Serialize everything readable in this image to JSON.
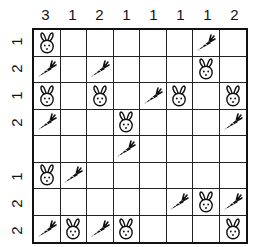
{
  "puzzle": {
    "columns": 8,
    "rows": 8,
    "column_clues": [
      "3",
      "1",
      "2",
      "1",
      "1",
      "1",
      "1",
      "2"
    ],
    "row_clues": [
      "1",
      "2",
      "1",
      "2",
      "",
      "1",
      "2",
      "2"
    ],
    "cells": [
      [
        "bunny",
        "",
        "",
        "",
        "",
        "",
        "carrot",
        ""
      ],
      [
        "carrot",
        "",
        "carrot",
        "",
        "",
        "",
        "bunny",
        ""
      ],
      [
        "bunny",
        "",
        "bunny",
        "",
        "carrot",
        "bunny",
        "",
        "bunny"
      ],
      [
        "carrot",
        "",
        "",
        "bunny",
        "",
        "",
        "",
        "carrot"
      ],
      [
        "",
        "",
        "",
        "carrot",
        "",
        "",
        "",
        ""
      ],
      [
        "bunny",
        "carrot",
        "",
        "",
        "",
        "",
        "",
        ""
      ],
      [
        "",
        "",
        "",
        "",
        "",
        "carrot",
        "bunny",
        "carrot"
      ],
      [
        "carrot",
        "bunny",
        "carrot",
        "bunny",
        "",
        "",
        "",
        "bunny"
      ]
    ]
  }
}
